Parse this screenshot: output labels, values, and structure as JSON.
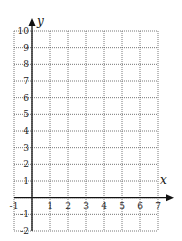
{
  "chart_data": {
    "type": "scatter",
    "title": "",
    "xlabel": "x",
    "ylabel": "y",
    "xlim": [
      -1,
      7
    ],
    "ylim": [
      -2,
      10
    ],
    "x_ticks": [
      -1,
      1,
      2,
      3,
      4,
      5,
      6,
      7
    ],
    "y_ticks": [
      10,
      9,
      8,
      7,
      6,
      5,
      4,
      3,
      2,
      1,
      -1,
      -2
    ],
    "grid": true,
    "grid_style": "dotted",
    "legend": null,
    "series": []
  },
  "colors": {
    "grid": "#555555",
    "axis": "#111111",
    "text": "#222222"
  }
}
